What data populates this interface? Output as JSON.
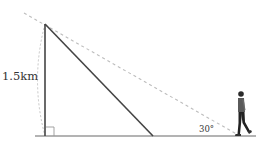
{
  "diagram": {
    "height_label": "1.5km",
    "angle_label": "30°",
    "colors": {
      "solid_line": "#444444",
      "ground": "#999999",
      "dashed": "#bbbbbb",
      "text": "#333333",
      "person_shirt": "#555555",
      "person_pants": "#222222"
    },
    "elements": {
      "pole": "vertical side",
      "hypotenuse": "solid slanted line",
      "sight_line": "dashed line of sight",
      "arc": "dashed arc marking height",
      "right_angle": "right angle marker",
      "person": "walking observer"
    }
  }
}
